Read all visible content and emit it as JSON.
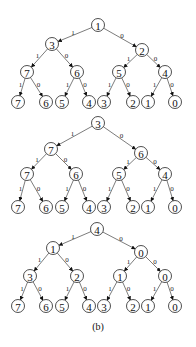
{
  "caption": "(b)",
  "edge_labels": {
    "left": "1",
    "right": "0"
  },
  "trees": [
    {
      "root": {
        "label": "1",
        "x": 98,
        "y": 25
      },
      "level1": [
        {
          "label": "3",
          "x": 52,
          "y": 44
        },
        {
          "label": "2",
          "x": 142,
          "y": 50
        }
      ],
      "level2": [
        {
          "label": "7",
          "x": 27,
          "y": 72
        },
        {
          "label": "6",
          "x": 77,
          "y": 72
        },
        {
          "label": "5",
          "x": 119,
          "y": 72
        },
        {
          "label": "4",
          "x": 165,
          "y": 72
        }
      ],
      "leaves": [
        {
          "label": "7",
          "x": 18,
          "y": 102
        },
        {
          "label": "6",
          "x": 46,
          "y": 102
        },
        {
          "label": "5",
          "x": 62,
          "y": 102
        },
        {
          "label": "4",
          "x": 89,
          "y": 102
        },
        {
          "label": "3",
          "x": 104,
          "y": 102
        },
        {
          "label": "2",
          "x": 133,
          "y": 102
        },
        {
          "label": "1",
          "x": 148,
          "y": 102
        },
        {
          "label": "0",
          "x": 175,
          "y": 102
        }
      ]
    },
    {
      "root": {
        "label": "3",
        "x": 98,
        "y": 123
      },
      "level1": [
        {
          "label": "7",
          "x": 51,
          "y": 149
        },
        {
          "label": "6",
          "x": 141,
          "y": 153
        }
      ],
      "level2": [
        {
          "label": "7",
          "x": 27,
          "y": 174
        },
        {
          "label": "6",
          "x": 76,
          "y": 174
        },
        {
          "label": "5",
          "x": 119,
          "y": 174
        },
        {
          "label": "4",
          "x": 165,
          "y": 174
        }
      ],
      "leaves": [
        {
          "label": "7",
          "x": 18,
          "y": 207
        },
        {
          "label": "6",
          "x": 46,
          "y": 207
        },
        {
          "label": "5",
          "x": 62,
          "y": 207
        },
        {
          "label": "4",
          "x": 89,
          "y": 207
        },
        {
          "label": "3",
          "x": 104,
          "y": 207
        },
        {
          "label": "2",
          "x": 133,
          "y": 207
        },
        {
          "label": "1",
          "x": 148,
          "y": 207
        },
        {
          "label": "0",
          "x": 175,
          "y": 207
        }
      ]
    },
    {
      "root": {
        "label": "4",
        "x": 97,
        "y": 229
      },
      "level1": [
        {
          "label": "1",
          "x": 53,
          "y": 248
        },
        {
          "label": "0",
          "x": 141,
          "y": 252
        }
      ],
      "level2": [
        {
          "label": "3",
          "x": 30,
          "y": 276
        },
        {
          "label": "2",
          "x": 77,
          "y": 276
        },
        {
          "label": "1",
          "x": 120,
          "y": 276
        },
        {
          "label": "0",
          "x": 165,
          "y": 276
        }
      ],
      "leaves": [
        {
          "label": "7",
          "x": 18,
          "y": 306
        },
        {
          "label": "6",
          "x": 46,
          "y": 306
        },
        {
          "label": "5",
          "x": 62,
          "y": 306
        },
        {
          "label": "4",
          "x": 89,
          "y": 306
        },
        {
          "label": "3",
          "x": 104,
          "y": 306
        },
        {
          "label": "2",
          "x": 133,
          "y": 306
        },
        {
          "label": "1",
          "x": 148,
          "y": 306
        },
        {
          "label": "0",
          "x": 175,
          "y": 306
        }
      ]
    }
  ]
}
